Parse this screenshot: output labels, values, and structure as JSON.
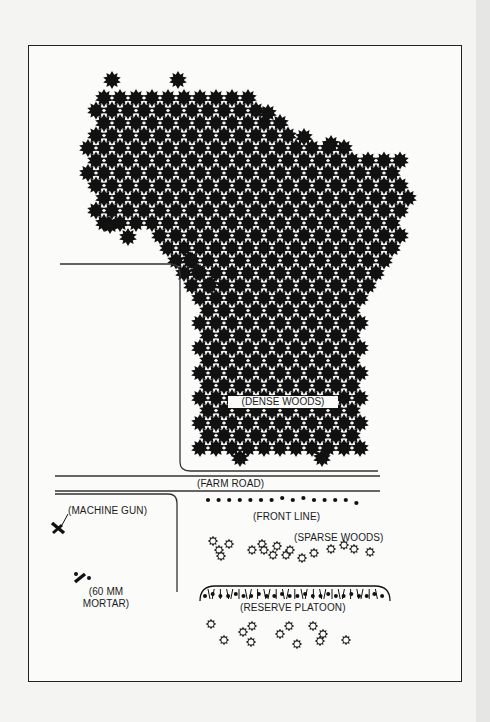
{
  "diagram": {
    "type": "tactical terrain map",
    "labels": {
      "dense_woods": "(DENSE WOODS)",
      "farm_road": "(FARM ROAD)",
      "machine_gun": "(MACHINE GUN)",
      "front_line": "(FRONT LINE)",
      "sparse_woods": "(SPARSE WOODS)",
      "mortar_line1": "(60 MM",
      "mortar_line2": "MORTAR)",
      "reserve_platoon": "(RESERVE PLATOON)"
    },
    "symbols": {
      "dense_woods": "filled-star-tree",
      "sparse_woods": "hollow-star-tree",
      "soldier_position": "filled-dot",
      "machine_gun": "machine-gun-symbol",
      "mortar": "mortar-symbol",
      "entrenchment": "hatched-arc-trench"
    },
    "colors": {
      "ink": "#111111",
      "paper": "#fbfbfa",
      "background": "#f4f4f2"
    }
  }
}
